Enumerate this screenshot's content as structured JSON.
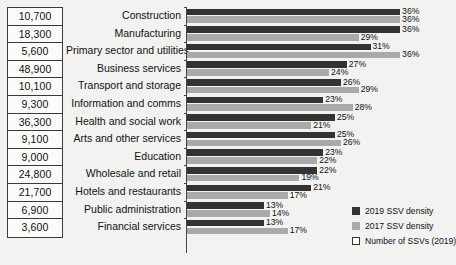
{
  "chart_data": {
    "type": "bar",
    "title": "",
    "subtitle": "",
    "xlabel": "",
    "ylabel": "",
    "orientation": "horizontal",
    "grid": false,
    "xlim": [
      0,
      36
    ],
    "legend_position": "bottom-right",
    "categories": [
      "Construction",
      "Manufacturing",
      "Primary sector and utilities",
      "Business services",
      "Transport and storage",
      "Information and comms",
      "Health and social work",
      "Arts and other services",
      "Education",
      "Wholesale and retail",
      "Hotels and restaurants",
      "Public administration",
      "Financial services"
    ],
    "series": [
      {
        "name": "2019 SSV density",
        "color": "#333333",
        "values": [
          36,
          36,
          31,
          27,
          26,
          23,
          25,
          25,
          23,
          22,
          21,
          13,
          13
        ],
        "labels": [
          "36%",
          "36%",
          "31%",
          "27%",
          "26%",
          "23%",
          "25%",
          "25%",
          "23%",
          "22%",
          "21%",
          "13%",
          "13%"
        ]
      },
      {
        "name": "2017 SSV density",
        "color": "#a9a9a9",
        "values": [
          36,
          29,
          36,
          24,
          29,
          28,
          21,
          26,
          22,
          19,
          17,
          14,
          17
        ],
        "labels": [
          "36%",
          "29%",
          "36%",
          "24%",
          "29%",
          "28%",
          "21%",
          "26%",
          "22%",
          "19%",
          "17%",
          "14%",
          "17%"
        ]
      }
    ],
    "counts": {
      "name": "Number of SSVs (2019)",
      "values": [
        "10,700",
        "18,300",
        "5,600",
        "48,900",
        "10,100",
        "9,300",
        "36,300",
        "9,100",
        "9,000",
        "24,800",
        "21,700",
        "6,900",
        "3,600"
      ]
    }
  },
  "legend": {
    "items": [
      {
        "label": "2019 SSV density",
        "color": "#333333",
        "style": "filled"
      },
      {
        "label": "2017 SSV density",
        "color": "#a9a9a9",
        "style": "filled"
      },
      {
        "label": "Number of SSVs (2019)",
        "color": "#ffffff",
        "style": "outline"
      }
    ]
  },
  "colors": {
    "background": "#f2f2f0",
    "series_2019": "#333333",
    "series_2017": "#a9a9a9",
    "axis": "#444444",
    "text": "#111111"
  }
}
